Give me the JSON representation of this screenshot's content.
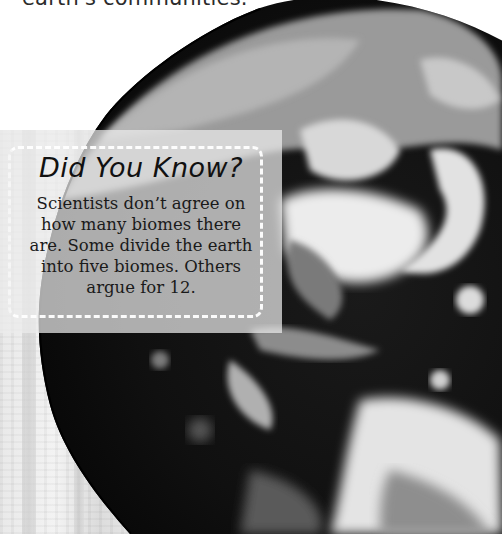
{
  "page": {
    "intro_text_fragment": "earth's communities."
  },
  "fact_box": {
    "title": "Did You Know?",
    "body_lines": [
      "Scientists don’t agree on",
      "how many biomes there",
      "are. Some divide the earth",
      "into five biomes. Others",
      "argue for 12."
    ]
  },
  "image": {
    "subject": "satellite-earth-globe",
    "colors": {
      "ocean": "#0d0d0d",
      "clouds": "#e6e6e6",
      "land": "#8a8a8a",
      "panel": "#ececec"
    }
  }
}
